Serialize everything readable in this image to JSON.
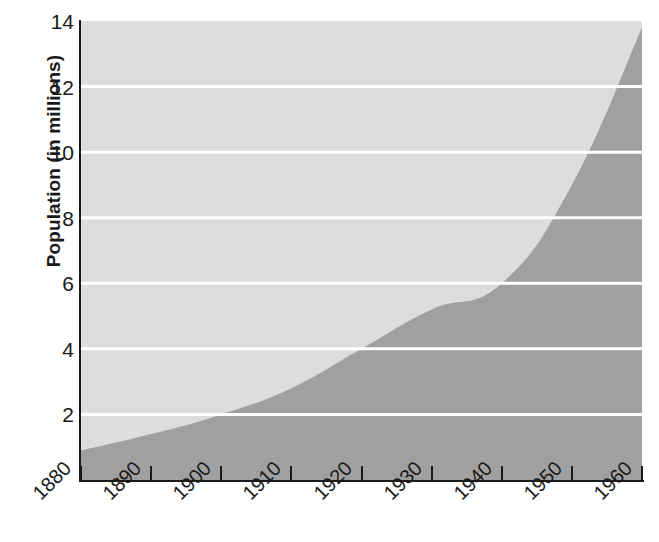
{
  "chart_data": {
    "type": "area",
    "title": "",
    "subtitle": "",
    "xlabel": "",
    "ylabel": "Population (in millions)",
    "x": [
      1880,
      1890,
      1900,
      1910,
      1920,
      1930,
      1940,
      1950,
      1960
    ],
    "categories": [
      "1880",
      "1890",
      "1900",
      "1910",
      "1920",
      "1930",
      "1940",
      "1950",
      "1960"
    ],
    "values": [
      0.9,
      1.4,
      2.0,
      2.8,
      4.0,
      5.2,
      6.0,
      9.0,
      13.8
    ],
    "series": [
      {
        "name": "Population",
        "values": [
          0.9,
          1.4,
          2.0,
          2.8,
          4.0,
          5.2,
          6.0,
          9.0,
          13.8
        ]
      }
    ],
    "xlim": [
      1880,
      1960
    ],
    "ylim": [
      0,
      14
    ],
    "x_ticks": [
      "1880",
      "1890",
      "1900",
      "1910",
      "1920",
      "1930",
      "1940",
      "1950",
      "1960"
    ],
    "y_ticks": [
      "2",
      "4",
      "6",
      "8",
      "10",
      "12",
      "14"
    ],
    "y_tick_values": [
      2,
      4,
      6,
      8,
      10,
      12,
      14
    ],
    "grid": "horizontal",
    "grid_color": "#ffffff",
    "legend": "none",
    "annotations": [],
    "colors": {
      "area_fill": "#a0a0a0",
      "plot_background": "#dddddd",
      "axis": "#1a1a1a",
      "gridline": "#ffffff",
      "page_background": "#ffffff",
      "text": "#1a1a1a"
    }
  }
}
